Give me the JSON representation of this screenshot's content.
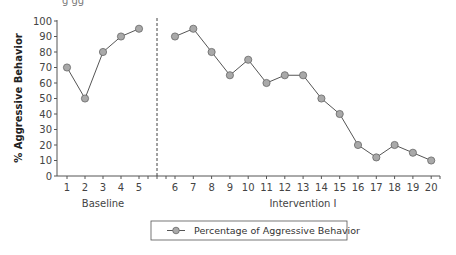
{
  "chart_data": {
    "type": "line",
    "title": "",
    "xlabel": "",
    "ylabel": "% Aggressive Behavior",
    "ylim": [
      0,
      100
    ],
    "yticks": [
      0,
      10,
      20,
      30,
      40,
      50,
      60,
      70,
      80,
      90,
      100
    ],
    "grid": false,
    "legend_position": "bottom",
    "phases": [
      {
        "label": "Baseline",
        "sessions": [
          1,
          2,
          3,
          4,
          5
        ]
      },
      {
        "label": "Intervention I",
        "sessions": [
          6,
          7,
          8,
          9,
          10,
          11,
          12,
          13,
          14,
          15,
          16,
          17,
          18,
          19,
          20
        ]
      }
    ],
    "phase_change_after_session": 5,
    "series": [
      {
        "name": "Percentage of Aggressive Behavior",
        "x": [
          1,
          2,
          3,
          4,
          5,
          6,
          7,
          8,
          9,
          10,
          11,
          12,
          13,
          14,
          15,
          16,
          17,
          18,
          19,
          20
        ],
        "values": [
          70,
          50,
          80,
          90,
          95,
          90,
          95,
          80,
          65,
          75,
          60,
          65,
          65,
          50,
          40,
          20,
          12,
          20,
          15,
          10
        ],
        "marker": "circle",
        "marker_color": "#a9a9a9",
        "line_color": "#555555"
      }
    ]
  },
  "legend": {
    "label": "Percentage of Aggressive Behavior"
  },
  "axis": {
    "ylabel": "% Aggressive Behavior",
    "baseline_label": "Baseline",
    "intervention_label": "Intervention I"
  }
}
